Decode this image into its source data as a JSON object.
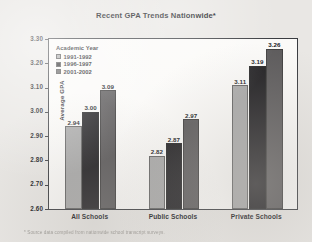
{
  "chart_data": {
    "type": "bar",
    "title": "Recent GPA Trends Nationwide*",
    "xlabel": "",
    "ylabel": "Average GPA",
    "categories": [
      "All Schools",
      "Public Schools",
      "Private Schools"
    ],
    "series": [
      {
        "name": "1991-1992",
        "values": [
          2.94,
          2.82,
          3.11
        ],
        "color": "#a9a9a9"
      },
      {
        "name": "1996-1997",
        "values": [
          3.0,
          2.87,
          3.19
        ],
        "color": "#201f22"
      },
      {
        "name": "2001-2002",
        "values": [
          3.09,
          2.97,
          3.26
        ],
        "color": "#5d5b5c"
      }
    ],
    "value_labels": [
      [
        "2.94",
        "3.00",
        "3.09"
      ],
      [
        "2.82",
        "2.87",
        "2.97"
      ],
      [
        "3.11",
        "3.19",
        "3.26"
      ]
    ],
    "ylim": [
      2.6,
      3.3
    ],
    "ytick_values": [
      3.3,
      3.2,
      3.1,
      3.0,
      2.9,
      2.8,
      2.7,
      2.6
    ],
    "ytick_labels": [
      "3.30",
      "3.20",
      "3.10",
      "3.00",
      "2.90",
      "2.80",
      "2.70",
      "2.60"
    ],
    "grid": false,
    "legend_title": "Academic Year",
    "legend_position": "top-left-inside"
  },
  "footnote": "* Source data compiled from nationwide school transcript surveys.",
  "icons": {
    "legend_swatch": "square-swatch-icon"
  }
}
